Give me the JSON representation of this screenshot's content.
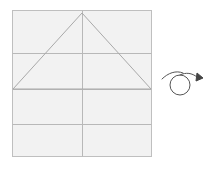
{
  "app": {
    "title": "Geometry Drawing Canvas",
    "background_color": "#ffffff"
  },
  "canvas": {
    "name": "square-grid-canvas",
    "x": 12,
    "y": 10,
    "width": 140,
    "height": 147,
    "fill_color": "#f2f2f2",
    "border_color": "#bfbfbf",
    "border_width": 1
  },
  "grid": {
    "line_color": "#b8b8b8",
    "line_width": 1,
    "horizontal_lines": [
      {
        "label": "horizontal-line-1",
        "y": 53
      },
      {
        "label": "horizontal-line-2",
        "y": 89
      },
      {
        "label": "horizontal-line-3",
        "y": 124
      }
    ],
    "vertical_lines": [
      {
        "label": "vertical-center-line",
        "x": 82
      }
    ]
  },
  "triangle": {
    "name": "isosceles-triangle",
    "stroke_color": "#a9a9a9",
    "stroke_width": 1,
    "fill": "none",
    "points": "82,13 13,89 151,89",
    "apex": {
      "x": 82,
      "y": 13
    },
    "base_left": {
      "x": 13,
      "y": 89
    },
    "base_right": {
      "x": 151,
      "y": 89
    }
  },
  "cursor_gesture": {
    "name": "loop-gesture-trail",
    "stroke_color": "#555555",
    "stroke_width": 1,
    "loop_center": {
      "x": 180,
      "y": 85
    },
    "loop_radius": 10,
    "tail_path": "M 162,79 C 168,73 176,70 183,73",
    "lead_path": "M 180,75 C 186,72 192,73 197,77",
    "arrow_points": "197,73 203,78 196,81",
    "arrow_color": "#444444"
  },
  "accessibility": {
    "canvas_description": "Square canvas with three horizontal gridlines, one vertical center gridline, and an isosceles triangle",
    "cursor_description": "Mouse loop gesture with arrowhead pointing right"
  }
}
